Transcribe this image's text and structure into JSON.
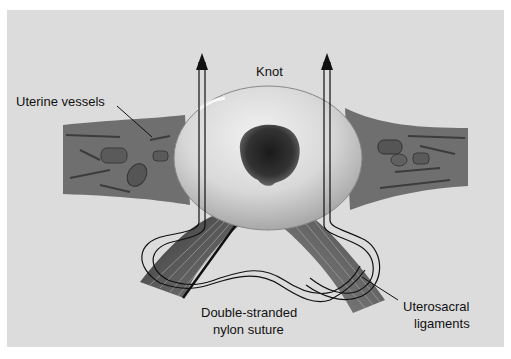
{
  "figure": {
    "labels": {
      "knot": "Knot",
      "uterine_vessels": "Uterine vessels",
      "suture_line1": "Double-stranded",
      "suture_line2": "nylon suture",
      "ligaments_line1": "Uterosacral",
      "ligaments_line2": "ligaments"
    },
    "colors": {
      "background": "#dcdcdc",
      "tissue": "#6e6e6e",
      "globe": "#d6d6d6",
      "os": "#2a2a2a",
      "suture": "#111111"
    }
  }
}
